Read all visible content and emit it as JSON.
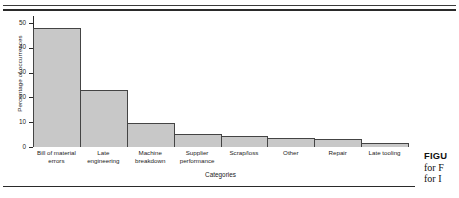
{
  "chart_data": {
    "type": "bar",
    "title": "",
    "subtitle": "",
    "xlabel": "Categories",
    "ylabel": "Percentage of occurrences",
    "categories": [
      "Bill of material errors",
      "Late engineering",
      "Machine breakdown",
      "Supplier performance",
      "Scrap/loss",
      "Other",
      "Repair",
      "Late tooling"
    ],
    "category_lines": [
      [
        "Bill of material",
        "errors"
      ],
      [
        "Late",
        "engineering"
      ],
      [
        "Machine",
        "breakdown"
      ],
      [
        "Supplier",
        "performance"
      ],
      [
        "Scrap/loss",
        ""
      ],
      [
        "Other",
        ""
      ],
      [
        "Repair",
        ""
      ],
      [
        "Late tooling",
        ""
      ]
    ],
    "values": [
      48,
      23,
      9.5,
      5.3,
      4.3,
      3.8,
      3.3,
      1.5
    ],
    "ylim": [
      0,
      52
    ],
    "yticks": [
      0,
      10,
      20,
      30,
      40,
      50
    ],
    "ytick_labels": [
      "0",
      "10",
      "20",
      "30",
      "40",
      "50"
    ],
    "grid": false,
    "legend": null,
    "bar_fill": "#c8c8c8",
    "bar_edge": "#444444",
    "bar_gap": 0
  },
  "caption": {
    "figure_label": "FIGU",
    "line2": "for F",
    "line3": "for I"
  },
  "rules": {
    "top": "double-rule",
    "bottom": "single-rule"
  }
}
